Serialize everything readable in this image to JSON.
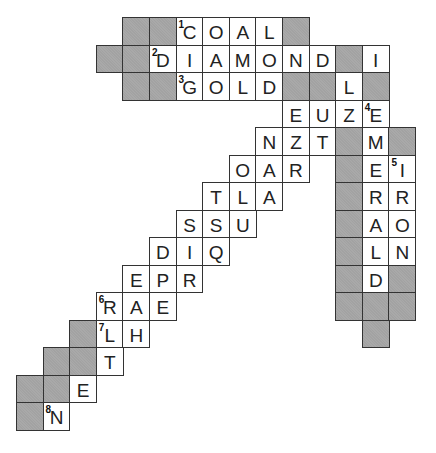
{
  "puzzle": {
    "title": "",
    "grid": {
      "origin_x": 16,
      "origin_y": 17,
      "cell_w": 26.6,
      "cell_h": 27.5,
      "colors": {
        "block": "#a9a9a9",
        "border": "#333333",
        "open": "#ffffff",
        "text": "#222222"
      }
    },
    "cells": [
      {
        "r": 0,
        "c": 4,
        "type": "block"
      },
      {
        "r": 0,
        "c": 5,
        "type": "block"
      },
      {
        "r": 0,
        "c": 6,
        "type": "letter",
        "ch": "C",
        "num": "1"
      },
      {
        "r": 0,
        "c": 7,
        "type": "letter",
        "ch": "O"
      },
      {
        "r": 0,
        "c": 8,
        "type": "letter",
        "ch": "A"
      },
      {
        "r": 0,
        "c": 9,
        "type": "letter",
        "ch": "L"
      },
      {
        "r": 0,
        "c": 10,
        "type": "block"
      },
      {
        "r": 1,
        "c": 3,
        "type": "block"
      },
      {
        "r": 1,
        "c": 4,
        "type": "block"
      },
      {
        "r": 1,
        "c": 5,
        "type": "letter",
        "ch": "D",
        "num": "2"
      },
      {
        "r": 1,
        "c": 6,
        "type": "letter",
        "ch": "I"
      },
      {
        "r": 1,
        "c": 7,
        "type": "letter",
        "ch": "A"
      },
      {
        "r": 1,
        "c": 8,
        "type": "letter",
        "ch": "M"
      },
      {
        "r": 1,
        "c": 9,
        "type": "letter",
        "ch": "O"
      },
      {
        "r": 1,
        "c": 10,
        "type": "letter",
        "ch": "N"
      },
      {
        "r": 1,
        "c": 11,
        "type": "letter",
        "ch": "D"
      },
      {
        "r": 1,
        "c": 12,
        "type": "block"
      },
      {
        "r": 1,
        "c": 13,
        "type": "letter",
        "ch": "I"
      },
      {
        "r": 2,
        "c": 4,
        "type": "block"
      },
      {
        "r": 2,
        "c": 5,
        "type": "block"
      },
      {
        "r": 2,
        "c": 6,
        "type": "letter",
        "ch": "G",
        "num": "3"
      },
      {
        "r": 2,
        "c": 7,
        "type": "letter",
        "ch": "O"
      },
      {
        "r": 2,
        "c": 8,
        "type": "letter",
        "ch": "L"
      },
      {
        "r": 2,
        "c": 9,
        "type": "letter",
        "ch": "D"
      },
      {
        "r": 2,
        "c": 10,
        "type": "block"
      },
      {
        "r": 2,
        "c": 11,
        "type": "block"
      },
      {
        "r": 2,
        "c": 12,
        "type": "letter",
        "ch": "L"
      },
      {
        "r": 2,
        "c": 13,
        "type": "block"
      },
      {
        "r": 3,
        "c": 10,
        "type": "letter",
        "ch": "E"
      },
      {
        "r": 3,
        "c": 11,
        "type": "letter",
        "ch": "U"
      },
      {
        "r": 3,
        "c": 12,
        "type": "letter",
        "ch": "Z"
      },
      {
        "r": 3,
        "c": 13,
        "type": "letter",
        "ch": "E",
        "num": "4"
      },
      {
        "r": 4,
        "c": 9,
        "type": "letter",
        "ch": "N"
      },
      {
        "r": 4,
        "c": 10,
        "type": "letter",
        "ch": "Z"
      },
      {
        "r": 4,
        "c": 11,
        "type": "letter",
        "ch": "T"
      },
      {
        "r": 4,
        "c": 12,
        "type": "block"
      },
      {
        "r": 4,
        "c": 13,
        "type": "letter",
        "ch": "M"
      },
      {
        "r": 4,
        "c": 14,
        "type": "block"
      },
      {
        "r": 5,
        "c": 8,
        "type": "letter",
        "ch": "O"
      },
      {
        "r": 5,
        "c": 9,
        "type": "letter",
        "ch": "A"
      },
      {
        "r": 5,
        "c": 10,
        "type": "letter",
        "ch": "R"
      },
      {
        "r": 5,
        "c": 12,
        "type": "block"
      },
      {
        "r": 5,
        "c": 13,
        "type": "letter",
        "ch": "E"
      },
      {
        "r": 5,
        "c": 14,
        "type": "letter",
        "ch": "I",
        "num": "5"
      },
      {
        "r": 6,
        "c": 7,
        "type": "letter",
        "ch": "T"
      },
      {
        "r": 6,
        "c": 8,
        "type": "letter",
        "ch": "L"
      },
      {
        "r": 6,
        "c": 9,
        "type": "letter",
        "ch": "A"
      },
      {
        "r": 6,
        "c": 12,
        "type": "block"
      },
      {
        "r": 6,
        "c": 13,
        "type": "letter",
        "ch": "R"
      },
      {
        "r": 6,
        "c": 14,
        "type": "letter",
        "ch": "R"
      },
      {
        "r": 7,
        "c": 6,
        "type": "letter",
        "ch": "S"
      },
      {
        "r": 7,
        "c": 7,
        "type": "letter",
        "ch": "S"
      },
      {
        "r": 7,
        "c": 8,
        "type": "letter",
        "ch": "U"
      },
      {
        "r": 7,
        "c": 12,
        "type": "block"
      },
      {
        "r": 7,
        "c": 13,
        "type": "letter",
        "ch": "A"
      },
      {
        "r": 7,
        "c": 14,
        "type": "letter",
        "ch": "O"
      },
      {
        "r": 8,
        "c": 5,
        "type": "letter",
        "ch": "D"
      },
      {
        "r": 8,
        "c": 6,
        "type": "letter",
        "ch": "I"
      },
      {
        "r": 8,
        "c": 7,
        "type": "letter",
        "ch": "Q"
      },
      {
        "r": 8,
        "c": 12,
        "type": "block"
      },
      {
        "r": 8,
        "c": 13,
        "type": "letter",
        "ch": "L"
      },
      {
        "r": 8,
        "c": 14,
        "type": "letter",
        "ch": "N"
      },
      {
        "r": 9,
        "c": 4,
        "type": "letter",
        "ch": "E"
      },
      {
        "r": 9,
        "c": 5,
        "type": "letter",
        "ch": "P"
      },
      {
        "r": 9,
        "c": 6,
        "type": "letter",
        "ch": "R"
      },
      {
        "r": 9,
        "c": 12,
        "type": "block"
      },
      {
        "r": 9,
        "c": 13,
        "type": "letter",
        "ch": "D"
      },
      {
        "r": 9,
        "c": 14,
        "type": "block"
      },
      {
        "r": 10,
        "c": 3,
        "type": "letter",
        "ch": "R",
        "num": "6"
      },
      {
        "r": 10,
        "c": 4,
        "type": "letter",
        "ch": "A"
      },
      {
        "r": 10,
        "c": 5,
        "type": "letter",
        "ch": "E"
      },
      {
        "r": 10,
        "c": 12,
        "type": "block"
      },
      {
        "r": 10,
        "c": 13,
        "type": "block"
      },
      {
        "r": 10,
        "c": 14,
        "type": "block"
      },
      {
        "r": 11,
        "c": 2,
        "type": "block"
      },
      {
        "r": 11,
        "c": 3,
        "type": "letter",
        "ch": "L",
        "num": "7"
      },
      {
        "r": 11,
        "c": 4,
        "type": "letter",
        "ch": "H"
      },
      {
        "r": 11,
        "c": 13,
        "type": "block"
      },
      {
        "r": 12,
        "c": 1,
        "type": "block"
      },
      {
        "r": 12,
        "c": 2,
        "type": "block"
      },
      {
        "r": 12,
        "c": 3,
        "type": "letter",
        "ch": "T"
      },
      {
        "r": 13,
        "c": 0,
        "type": "block"
      },
      {
        "r": 13,
        "c": 1,
        "type": "block"
      },
      {
        "r": 13,
        "c": 2,
        "type": "letter",
        "ch": "E"
      },
      {
        "r": 14,
        "c": 0,
        "type": "block"
      },
      {
        "r": 14,
        "c": 1,
        "type": "letter",
        "ch": "N",
        "num": "8"
      }
    ]
  }
}
